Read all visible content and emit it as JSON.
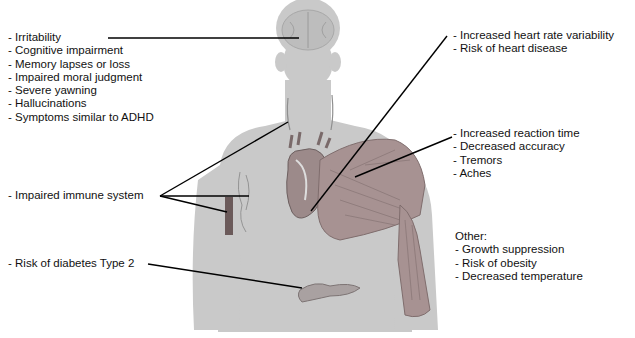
{
  "diagram": {
    "title": "",
    "colors": {
      "background": "#ffffff",
      "body_silhouette": "#c8c8c8",
      "muscle": "#8a7070",
      "leader_line": "#000000",
      "text": "#111111"
    },
    "brain_effects": {
      "organ": "brain",
      "items": [
        "- Irritability",
        "- Cognitive impairment",
        "- Memory lapses or loss",
        "- Impaired moral judgment",
        "- Severe yawning",
        "- Hallucinations",
        "- Symptoms similar to ADHD"
      ]
    },
    "heart_effects": {
      "organ": "heart",
      "items": [
        "- Increased heart rate variability",
        "- Risk of heart disease"
      ]
    },
    "muscle_effects": {
      "organ": "muscles",
      "items": [
        "- Increased reaction time",
        "- Decreased accuracy",
        "- Tremors",
        "- Aches"
      ]
    },
    "immune_effects": {
      "organ": "lymph nodes / bone marrow",
      "items": [
        "- Impaired immune system"
      ]
    },
    "pancreas_effects": {
      "organ": "pancreas",
      "items": [
        "- Risk of diabetes Type 2"
      ]
    },
    "other_effects": {
      "heading": "Other:",
      "items": [
        "- Growth suppression",
        "- Risk of obesity",
        "- Decreased temperature"
      ]
    }
  }
}
